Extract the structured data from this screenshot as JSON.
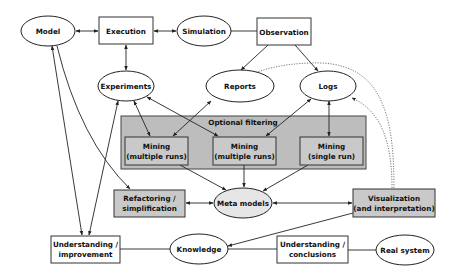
{
  "diagram": {
    "nodes": {
      "model": {
        "label": "Model",
        "shape": "ellipse"
      },
      "execution": {
        "label": "Execution",
        "shape": "box"
      },
      "simulation": {
        "label": "Simulation",
        "shape": "ellipse"
      },
      "observation": {
        "label": "Observation",
        "shape": "box"
      },
      "experiments": {
        "label": "Experiments",
        "shape": "ellipse"
      },
      "reports": {
        "label": "Reports",
        "shape": "ellipse"
      },
      "logs": {
        "label": "Logs",
        "shape": "ellipse"
      },
      "optional_filtering": {
        "label": "Optional filtering",
        "shape": "group"
      },
      "mining_multi_1": {
        "line1": "Mining",
        "line2": "(multiple runs)",
        "shape": "shaded-box"
      },
      "mining_multi_2": {
        "line1": "Mining",
        "line2": "(multiple runs)",
        "shape": "shaded-box"
      },
      "mining_single": {
        "line1": "Mining",
        "line2": "(single run)",
        "shape": "shaded-box"
      },
      "refactoring": {
        "line1": "Refactoring /",
        "line2": "simplification",
        "shape": "shaded-box"
      },
      "meta_models": {
        "label": "Meta models",
        "shape": "shaded-ellipse"
      },
      "visualization": {
        "line1": "Visualization",
        "line2": "(and interpretation)",
        "shape": "shaded-box"
      },
      "understanding_improvement": {
        "line1": "Understanding /",
        "line2": "improvement",
        "shape": "box"
      },
      "knowledge": {
        "label": "Knowledge",
        "shape": "ellipse"
      },
      "understanding_conclusions": {
        "line1": "Understanding /",
        "line2": "conclusions",
        "shape": "box"
      },
      "real_system": {
        "label": "Real system",
        "shape": "ellipse"
      }
    },
    "edges": [
      {
        "from": "model",
        "to": "execution",
        "type": "bidirectional"
      },
      {
        "from": "execution",
        "to": "simulation",
        "type": "bidirectional"
      },
      {
        "from": "simulation",
        "to": "observation",
        "type": "line"
      },
      {
        "from": "execution",
        "to": "experiments",
        "type": "bidirectional"
      },
      {
        "from": "observation",
        "to": "reports",
        "type": "arrow"
      },
      {
        "from": "observation",
        "to": "logs",
        "type": "arrow"
      },
      {
        "from": "experiments",
        "to": "mining_multi_1",
        "type": "bidirectional"
      },
      {
        "from": "experiments",
        "to": "mining_multi_2",
        "type": "bidirectional"
      },
      {
        "from": "reports",
        "to": "mining_multi_1",
        "type": "bidirectional"
      },
      {
        "from": "logs",
        "to": "mining_multi_2",
        "type": "bidirectional"
      },
      {
        "from": "logs",
        "to": "mining_single",
        "type": "bidirectional"
      },
      {
        "from": "mining_multi_1",
        "to": "meta_models",
        "type": "arrow"
      },
      {
        "from": "mining_multi_2",
        "to": "meta_models",
        "type": "arrow"
      },
      {
        "from": "mining_single",
        "to": "meta_models",
        "type": "arrow"
      },
      {
        "from": "refactoring",
        "to": "meta_models",
        "type": "bidirectional"
      },
      {
        "from": "meta_models",
        "to": "visualization",
        "type": "bidirectional"
      },
      {
        "from": "model",
        "to": "refactoring",
        "type": "arrow"
      },
      {
        "from": "model",
        "to": "understanding_improvement",
        "type": "bidirectional"
      },
      {
        "from": "experiments",
        "to": "understanding_improvement",
        "type": "arrow"
      },
      {
        "from": "visualization",
        "to": "knowledge",
        "type": "arrow"
      },
      {
        "from": "understanding_improvement",
        "to": "knowledge",
        "type": "line"
      },
      {
        "from": "knowledge",
        "to": "understanding_conclusions",
        "type": "line"
      },
      {
        "from": "understanding_conclusions",
        "to": "real_system",
        "type": "line"
      },
      {
        "from": "visualization",
        "to": "reports",
        "type": "dotted-arrow"
      },
      {
        "from": "visualization",
        "to": "logs",
        "type": "dotted-arrow"
      }
    ]
  }
}
